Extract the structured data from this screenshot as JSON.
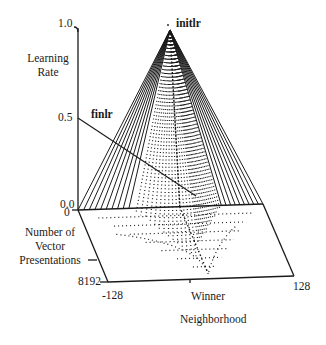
{
  "diagram": {
    "type": "3d-surface-plot",
    "axes": {
      "vertical": {
        "label_line1": "Learning",
        "label_line2": "Rate",
        "ticks": [
          "1.0",
          "0.5",
          "0.0"
        ]
      },
      "depth": {
        "label_line1": "Number of",
        "label_line2": "Vector",
        "label_line3": "Presentations",
        "ticks": [
          "0",
          "8192"
        ]
      },
      "horizontal": {
        "label_line1": "Winner",
        "label_line2": "Neighborhood",
        "ticks": [
          "-128",
          "128"
        ]
      }
    },
    "annotations": {
      "initial_lr": "initlr",
      "final_lr": "finlr"
    },
    "colors": {
      "ink": "#1a1a1a",
      "background": "#ffffff"
    }
  }
}
